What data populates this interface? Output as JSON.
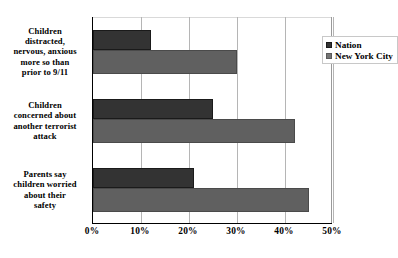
{
  "chart_data": {
    "type": "bar",
    "orientation": "horizontal",
    "title": "",
    "subtitle": "",
    "xlabel": "",
    "ylabel": "",
    "xlim": [
      0,
      50
    ],
    "grid": true,
    "grid_axis": "x",
    "legend_position": "top-right inside plot",
    "categories": [
      "Children distracted, nervous, anxious more so than prior to 9/11",
      "Children concerned about another terrorist attack",
      "Parents say children worried about their safety"
    ],
    "category_lines": [
      [
        "Children",
        "distracted,",
        "nervous, anxious",
        "more so than",
        "prior to 9/11"
      ],
      [
        "Children",
        "concerned about",
        "another terrorist",
        "attack"
      ],
      [
        "Parents say",
        "children worried",
        "about their",
        "safety"
      ]
    ],
    "series": [
      {
        "name": "Nation",
        "color": "#333333",
        "values": [
          12,
          25,
          21
        ]
      },
      {
        "name": "New York City",
        "color": "#606060",
        "values": [
          30,
          42,
          45
        ]
      }
    ],
    "tick_labels": [
      "0%",
      "10%",
      "20%",
      "30%",
      "40%",
      "50%"
    ],
    "tick_values": [
      0,
      10,
      20,
      30,
      40,
      50
    ],
    "value_suffix": "%"
  },
  "legend": {
    "items": [
      {
        "label": "Nation",
        "swatch": "nation"
      },
      {
        "label": "New York City",
        "swatch": "nyc"
      }
    ]
  },
  "colors": {
    "nation": "#333333",
    "new_york_city": "#606060",
    "axis": "#000000",
    "gridline": "#b5b5b5",
    "background": "#ffffff"
  }
}
